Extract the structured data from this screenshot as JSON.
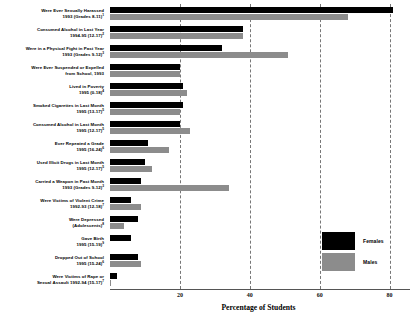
{
  "chart_data": {
    "type": "bar",
    "orientation": "horizontal",
    "title": "",
    "xlabel": "Percentage of Students",
    "ylabel": "",
    "xlim": [
      0,
      85
    ],
    "xticks": [
      20,
      40,
      60,
      80
    ],
    "grid": true,
    "grid_style": "dashed vertical",
    "legend_position": "bottom-right",
    "categories": [
      "Were Ever Sexually Harassed 1993 (Grades 8-11)",
      "Consumed Alcohol in Last Year 1994-95 (12-17)",
      "Were in a Physical Fight in Past Year 1993 (Grades 9-12)",
      "Were Ever Suspended or Expelled from School, 1993",
      "Lived in Poverty 1995 (0-18)",
      "Smoked Cigarettes in Last Month 1995 (13-17)",
      "Consumed Alcohol in Last Month 1995 (12-17)",
      "Ever Repeated a Grade 1995 (16-24)",
      "Used Illicit Drugs in Last Month 1995 (12-17)",
      "Carried a Weapon in Past Month 1993 (Grades 9-12)",
      "Were Victims of Violent Crime 1992-93 (12-18)",
      "Were Depressed (Adolescents)",
      "Gave Birth 1995 (15-19)",
      "Dropped Out of School 1995 (15-24)",
      "Were Victims of Rape or Sexual Assault 1992-94 (15-17)"
    ],
    "series": [
      {
        "name": "Females",
        "color": "#000000",
        "values": [
          81,
          38,
          32,
          20,
          21,
          21,
          20,
          11,
          10,
          9,
          6,
          8,
          6,
          8,
          2
        ]
      },
      {
        "name": "Males",
        "color": "#8c8c8c",
        "values": [
          68,
          38,
          51,
          20,
          22,
          20,
          23,
          17,
          12,
          34,
          9,
          4,
          0,
          9,
          0.4
        ]
      }
    ]
  },
  "rows": [
    {
      "line1": "Were Ever Sexually Harassed",
      "line2": "1993 (Grades 8-11)",
      "note": "1"
    },
    {
      "line1": "Consumed Alcohol in Last Year",
      "line2": "1994-95 (12-17)",
      "note": "2"
    },
    {
      "line1": "Were in a Physical Fight in Past Year",
      "line2": "1993 (Grades 9-12)",
      "note": "3"
    },
    {
      "line1": "Were Ever Suspended or Expelled",
      "line2": "from School, 1993",
      "note": ""
    },
    {
      "line1": "Lived in Poverty",
      "line2": "1995 (0-18)",
      "note": "4"
    },
    {
      "line1": "Smoked Cigarettes in Last Month",
      "line2": "1995 (13-17)",
      "note": "5"
    },
    {
      "line1": "Consumed Alcohol in Last Month",
      "line2": "1995 (12-17)",
      "note": "5"
    },
    {
      "line1": "Ever Repeated a Grade",
      "line2": "1995 (16-24)",
      "note": "6"
    },
    {
      "line1": "Used Illicit Drugs in Last Month",
      "line2": "1995 (12-17)",
      "note": "5"
    },
    {
      "line1": "Carried a Weapon in Past Month",
      "line2": "1993 (Grades 9-12)",
      "note": "3"
    },
    {
      "line1": "Were Victims of Violent Crime",
      "line2": "1992-93 (12-18)",
      "note": "7"
    },
    {
      "line1": "Were Depressed",
      "line2": "(Adolescents)",
      "note": "8"
    },
    {
      "line1": "Gave Birth",
      "line2": "1995 (15-19)",
      "note": "9"
    },
    {
      "line1": "Dropped Out of School",
      "line2": "1995 (15-24)",
      "note": "6"
    },
    {
      "line1": "Were Victims of Rape or",
      "line2": "Sexual Assault 1992-94 (15-17)",
      "note": "7"
    }
  ],
  "axis": {
    "title": "Percentage of Students",
    "ticks": [
      "20",
      "40",
      "60",
      "80"
    ]
  },
  "legend": {
    "items": [
      {
        "label": "Females",
        "color": "#000000"
      },
      {
        "label": "Males",
        "color": "#8c8c8c"
      }
    ]
  }
}
